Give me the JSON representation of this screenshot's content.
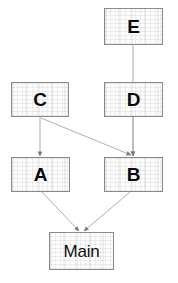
{
  "diagram": {
    "background_color": "#ffffff",
    "node_fill_color": "#fdfdfd",
    "node_border_color": "#8a8a8a",
    "edge_color": "#9a9a9a",
    "label_color": "#0a0a0a",
    "nodes": [
      {
        "id": "E",
        "label": "E",
        "x": 104,
        "y": 8,
        "w": 59,
        "h": 37
      },
      {
        "id": "C",
        "label": "C",
        "x": 11,
        "y": 82,
        "w": 58,
        "h": 35
      },
      {
        "id": "D",
        "label": "D",
        "x": 104,
        "y": 82,
        "w": 59,
        "h": 35
      },
      {
        "id": "A",
        "label": "A",
        "x": 11,
        "y": 157,
        "w": 59,
        "h": 35
      },
      {
        "id": "B",
        "label": "B",
        "x": 104,
        "y": 157,
        "w": 59,
        "h": 35
      },
      {
        "id": "Main",
        "label": "Main",
        "x": 49,
        "y": 232,
        "w": 65,
        "h": 38
      }
    ],
    "edges": [
      {
        "from": "E",
        "to": "D",
        "x1": 133,
        "y1": 45,
        "x2": 133,
        "y2": 156
      },
      {
        "from": "C",
        "to": "A",
        "x1": 40,
        "y1": 117,
        "x2": 40,
        "y2": 156
      },
      {
        "from": "C",
        "to": "B",
        "x1": 41,
        "y1": 118,
        "x2": 131,
        "y2": 155
      },
      {
        "from": "D",
        "to": "B",
        "x1": 133,
        "y1": 117,
        "x2": 133,
        "y2": 156
      },
      {
        "from": "A",
        "to": "Main",
        "x1": 42,
        "y1": 192,
        "x2": 79,
        "y2": 231
      },
      {
        "from": "B",
        "to": "Main",
        "x1": 130,
        "y1": 192,
        "x2": 84,
        "y2": 231
      }
    ]
  }
}
